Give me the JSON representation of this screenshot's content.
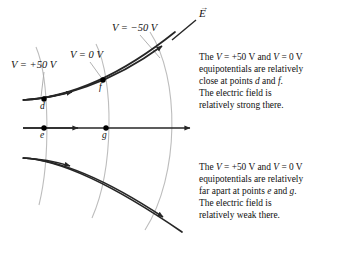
{
  "figure": {
    "background": "#ffffff",
    "field_line_color": "#262626",
    "equipotential_color": "#b9b9b9",
    "point_color": "#000000",
    "leader_color": "#9a9a9a"
  },
  "vector_label": {
    "symbol": "E",
    "accent": "→",
    "name": "electric-field-vector"
  },
  "equipotentials": [
    {
      "id": "eq-plus50",
      "label": "V = +50 V",
      "value": 50,
      "unit": "V"
    },
    {
      "id": "eq-zero",
      "label": "V = 0 V",
      "value": 0,
      "unit": "V"
    },
    {
      "id": "eq-minus50",
      "label": "V = −50 V",
      "value": -50,
      "unit": "V"
    }
  ],
  "points": [
    {
      "id": "d",
      "label": "d",
      "on_line": "upper-field-line",
      "equipotential": "eq-plus50"
    },
    {
      "id": "f",
      "label": "f",
      "on_line": "upper-field-line",
      "equipotential": "eq-zero"
    },
    {
      "id": "e",
      "label": "e",
      "on_line": "middle-field-line",
      "equipotential": "eq-plus50"
    },
    {
      "id": "g",
      "label": "g",
      "on_line": "middle-field-line",
      "equipotential": "eq-zero"
    }
  ],
  "field_lines": [
    {
      "id": "upper-field-line",
      "direction": "up-right"
    },
    {
      "id": "middle-field-line",
      "direction": "right"
    },
    {
      "id": "lower-field-line",
      "direction": "down-right"
    }
  ],
  "annotations": {
    "strong": {
      "line1_a": "The ",
      "line1_v1": "V",
      "line1_b": " = +50 V and ",
      "line1_v2": "V",
      "line1_c": " = 0 V",
      "line2": "equipotentials are relatively",
      "line3_a": "close at points ",
      "line3_p1": "d",
      "line3_b": " and ",
      "line3_p2": "f",
      "line3_c": ".",
      "line4": "The electric field is",
      "line5": "relatively strong there."
    },
    "weak": {
      "line1_a": "The ",
      "line1_v1": "V",
      "line1_b": " = +50 V and ",
      "line1_v2": "V",
      "line1_c": " = 0 V",
      "line2": "equipotentials are relatively",
      "line3_a": "far apart at points ",
      "line3_p1": "e",
      "line3_b": " and ",
      "line3_p2": "g",
      "line3_c": ".",
      "line4": "The electric field is",
      "line5": "relatively weak there."
    }
  }
}
